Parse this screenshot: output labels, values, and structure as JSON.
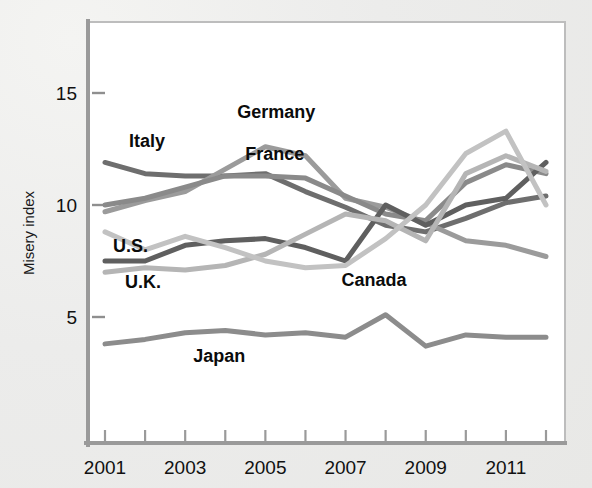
{
  "chart_data": {
    "type": "line",
    "title": "",
    "xlabel": "",
    "ylabel": "Misery index",
    "xlim": [
      2001,
      2012
    ],
    "ylim": [
      0,
      17
    ],
    "yticks": [
      5,
      10,
      15
    ],
    "ytick_labels": [
      "5",
      "10",
      "15"
    ],
    "xticks": [
      2001,
      2003,
      2005,
      2007,
      2009,
      2011
    ],
    "xtick_labels": [
      "2001",
      "2003",
      "2005",
      "2007",
      "2009",
      "2011"
    ],
    "minor_xticks": [
      2002,
      2004,
      2006,
      2008,
      2010,
      2012
    ],
    "grid": false,
    "legend": "inline-labels",
    "x": [
      2001,
      2002,
      2003,
      2004,
      2005,
      2006,
      2007,
      2008,
      2009,
      2010,
      2011,
      2012
    ],
    "series": [
      {
        "name": "Italy",
        "color": "#6e6e6e",
        "label_x": 2001.6,
        "label_y": 12.6,
        "values": [
          11.9,
          11.4,
          11.3,
          11.3,
          11.4,
          10.6,
          9.9,
          9.1,
          8.8,
          9.4,
          10.1,
          10.4
        ]
      },
      {
        "name": "Germany",
        "color": "#9b9b9b",
        "label_x": 2004.3,
        "label_y": 13.9,
        "values": [
          9.7,
          10.2,
          10.6,
          11.6,
          12.6,
          12.2,
          10.3,
          9.9,
          9.2,
          8.4,
          8.2,
          7.7
        ]
      },
      {
        "name": "France",
        "color": "#8a8a8a",
        "label_x": 2004.5,
        "label_y": 12.0,
        "values": [
          10.0,
          10.3,
          10.8,
          11.3,
          11.3,
          11.2,
          10.4,
          9.6,
          9.3,
          11.0,
          11.8,
          11.4
        ]
      },
      {
        "name": "U.S.",
        "color": "#5f5f5f",
        "label_x": 2001.2,
        "label_y": 7.9,
        "values": [
          7.5,
          7.5,
          8.2,
          8.4,
          8.5,
          8.1,
          7.5,
          10.0,
          9.1,
          10.0,
          10.3,
          11.9
        ]
      },
      {
        "name": "U.K.",
        "color": "#b5b5b5",
        "label_x": 2001.5,
        "label_y": 6.3,
        "values": [
          7.0,
          7.2,
          7.1,
          7.3,
          7.8,
          8.7,
          9.6,
          9.3,
          8.4,
          11.4,
          12.2,
          11.5
        ]
      },
      {
        "name": "Canada",
        "color": "#c2c2c2",
        "label_x": 2006.9,
        "label_y": 6.4,
        "values": [
          8.8,
          8.0,
          8.6,
          8.1,
          7.5,
          7.2,
          7.3,
          8.5,
          10.0,
          12.3,
          13.3,
          10.0
        ]
      },
      {
        "name": "Japan",
        "color": "#8c8c8c",
        "label_x": 2003.2,
        "label_y": 3.0,
        "values": [
          3.8,
          4.0,
          4.3,
          4.4,
          4.2,
          4.3,
          4.1,
          5.1,
          3.7,
          4.2,
          4.1,
          4.1
        ]
      }
    ]
  }
}
